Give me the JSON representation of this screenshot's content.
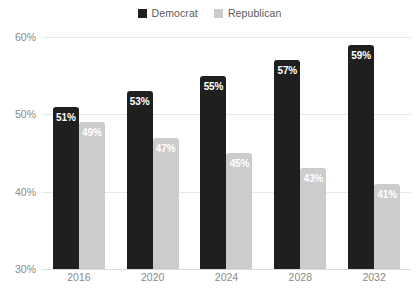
{
  "chart_data": {
    "type": "bar",
    "title": "",
    "subtitle": "",
    "xlabel": "",
    "ylabel": "",
    "categories": [
      "2016",
      "2020",
      "2024",
      "2028",
      "2032"
    ],
    "series": [
      {
        "name": "Democrat",
        "color": "#1f1f1f",
        "values": [
          51,
          53,
          55,
          57,
          59
        ],
        "labels": [
          "51%",
          "53%",
          "55%",
          "57%",
          "59%"
        ]
      },
      {
        "name": "Republican",
        "color": "#cccccc",
        "values": [
          49,
          47,
          45,
          43,
          41
        ],
        "labels": [
          "49%",
          "47%",
          "45%",
          "43%",
          "41%"
        ]
      }
    ],
    "ylim": [
      30,
      60
    ],
    "yticks": [
      30,
      40,
      50,
      60
    ],
    "ytick_labels": [
      "30%",
      "40%",
      "50%",
      "60%"
    ],
    "grid": true,
    "legend_position": "top-center",
    "value_label_position": "inside-top",
    "background_color": "#ffffff",
    "grid_color": "#e8e8e8",
    "tick_label_color": "#8a8a8a",
    "value_label_color": "#ffffff"
  },
  "legend": {
    "items": [
      {
        "label": "Democrat",
        "color": "#1f1f1f"
      },
      {
        "label": "Republican",
        "color": "#cccccc"
      }
    ]
  },
  "axes": {
    "y": {
      "ticks": [
        {
          "label": "60%",
          "value": 60
        },
        {
          "label": "50%",
          "value": 50
        },
        {
          "label": "40%",
          "value": 40
        },
        {
          "label": "30%",
          "value": 30
        }
      ]
    },
    "x": {
      "ticks": [
        {
          "label": "2016"
        },
        {
          "label": "2020"
        },
        {
          "label": "2024"
        },
        {
          "label": "2028"
        },
        {
          "label": "2032"
        }
      ]
    }
  }
}
